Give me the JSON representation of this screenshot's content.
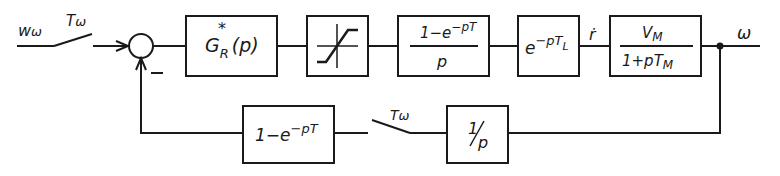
{
  "diagram": {
    "type": "control block diagram",
    "input": {
      "label": "w",
      "sub": "ω"
    },
    "input_switch": {
      "label": "T",
      "sub": "ω"
    },
    "summing_junction": {
      "minus_sign": "−"
    },
    "blocks": [
      {
        "id": "controller",
        "main": "G",
        "sub": "R",
        "sup": "*",
        "arg": "(p)"
      },
      {
        "id": "saturation",
        "symbol": "saturation-curve"
      },
      {
        "id": "zoh",
        "num": "1−e",
        "num_exp": "−pT",
        "den": "p"
      },
      {
        "id": "delay",
        "base": "e",
        "exp": "−pT",
        "exp_sub": "L"
      },
      {
        "id": "motor",
        "num": "V",
        "num_sub": "M",
        "den": "1+pT",
        "den_sub": "M"
      }
    ],
    "signal_r_dot": "ṙ",
    "output": {
      "label": "ω"
    },
    "feedback": {
      "integrator": {
        "num": "1",
        "den": "p"
      },
      "switch": {
        "label": "T",
        "sub": "ω"
      },
      "hold": {
        "base": "1−e",
        "exp": "−pT"
      }
    }
  }
}
